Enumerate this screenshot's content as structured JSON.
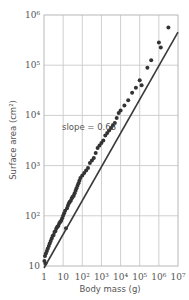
{
  "chart_data": {
    "type": "scatter",
    "title": "",
    "xlabel": "Body mass (g)",
    "ylabel": "Surface area (cm²)",
    "xscale": "log",
    "yscale": "log",
    "xlim": [
      1,
      10000000
    ],
    "ylim": [
      10,
      1000000
    ],
    "x_tick_labels": [
      "1",
      "10",
      "10²",
      "10³",
      "10⁴",
      "10⁵",
      "10⁶",
      "10⁷"
    ],
    "y_tick_labels": [
      "10",
      "10²",
      "10³",
      "10⁴",
      "10⁵",
      "10⁶"
    ],
    "grid": true,
    "annotation": "slope = 0.63",
    "fit_line": {
      "slope": 0.63,
      "log_x": [
        0,
        7
      ],
      "log_y": [
        0.96,
        5.66
      ]
    },
    "points_log": [
      [
        0.02,
        1.1
      ],
      [
        0.05,
        1.2
      ],
      [
        0.08,
        1.05
      ],
      [
        0.1,
        1.25
      ],
      [
        0.15,
        1.3
      ],
      [
        0.2,
        1.35
      ],
      [
        0.25,
        1.4
      ],
      [
        0.3,
        1.45
      ],
      [
        0.35,
        1.5
      ],
      [
        0.4,
        1.55
      ],
      [
        0.45,
        1.6
      ],
      [
        0.5,
        1.62
      ],
      [
        0.55,
        1.68
      ],
      [
        0.6,
        1.7
      ],
      [
        0.65,
        1.75
      ],
      [
        0.7,
        1.78
      ],
      [
        0.75,
        1.8
      ],
      [
        0.8,
        1.85
      ],
      [
        0.85,
        1.88
      ],
      [
        0.9,
        1.9
      ],
      [
        0.95,
        1.95
      ],
      [
        1.0,
        2.0
      ],
      [
        1.05,
        2.05
      ],
      [
        1.1,
        2.1
      ],
      [
        1.15,
        1.75
      ],
      [
        1.2,
        2.15
      ],
      [
        1.25,
        2.2
      ],
      [
        1.3,
        2.25
      ],
      [
        1.35,
        2.28
      ],
      [
        1.4,
        2.3
      ],
      [
        1.45,
        2.35
      ],
      [
        1.5,
        2.38
      ],
      [
        1.55,
        2.4
      ],
      [
        1.6,
        2.45
      ],
      [
        1.65,
        2.5
      ],
      [
        1.7,
        2.55
      ],
      [
        1.75,
        2.6
      ],
      [
        1.8,
        2.65
      ],
      [
        1.85,
        2.7
      ],
      [
        1.9,
        2.75
      ],
      [
        2.0,
        2.8
      ],
      [
        2.1,
        2.85
      ],
      [
        2.2,
        2.9
      ],
      [
        2.3,
        2.95
      ],
      [
        2.4,
        3.05
      ],
      [
        2.5,
        3.1
      ],
      [
        2.6,
        3.15
      ],
      [
        2.7,
        3.25
      ],
      [
        2.8,
        3.35
      ],
      [
        2.9,
        3.4
      ],
      [
        3.0,
        3.45
      ],
      [
        3.1,
        3.5
      ],
      [
        3.2,
        3.6
      ],
      [
        3.3,
        3.65
      ],
      [
        3.4,
        3.7
      ],
      [
        3.5,
        3.75
      ],
      [
        3.6,
        3.8
      ],
      [
        3.7,
        3.85
      ],
      [
        3.8,
        3.95
      ],
      [
        3.9,
        4.05
      ],
      [
        4.0,
        4.1
      ],
      [
        4.2,
        4.2
      ],
      [
        4.4,
        4.3
      ],
      [
        4.6,
        4.45
      ],
      [
        4.8,
        4.55
      ],
      [
        5.0,
        4.7
      ],
      [
        5.1,
        4.6
      ],
      [
        5.4,
        4.95
      ],
      [
        5.6,
        5.1
      ],
      [
        6.0,
        5.45
      ],
      [
        6.1,
        5.35
      ],
      [
        6.5,
        5.75
      ]
    ]
  }
}
